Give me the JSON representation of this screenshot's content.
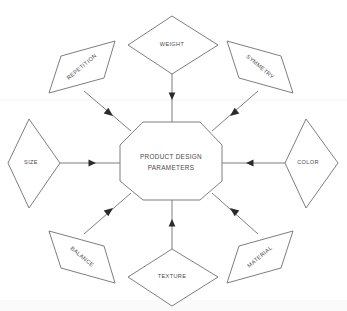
{
  "diagram": {
    "type": "radial-concept-map",
    "center": {
      "id": "center-node",
      "shape": "octagon",
      "label_line1": "PRODUCT DESIGN",
      "label_line2": "PARAMETERS"
    },
    "nodes": [
      {
        "id": "weight",
        "label": "WEIGHT",
        "shape": "diamond-horizontal",
        "position": "top",
        "rotation": 0,
        "arrow_direction": "down-toward-center"
      },
      {
        "id": "repetition",
        "label": "REPETITION",
        "shape": "parallelogram",
        "position": "top-left",
        "rotation": -45,
        "arrow_direction": "down-right-toward-center"
      },
      {
        "id": "symmetry",
        "label": "SYMMETRY",
        "shape": "parallelogram",
        "position": "top-right",
        "rotation": 45,
        "arrow_direction": "down-left-toward-center"
      },
      {
        "id": "size",
        "label": "SIZE",
        "shape": "diamond-vertical",
        "position": "left",
        "rotation": 0,
        "arrow_direction": "right-toward-center"
      },
      {
        "id": "color",
        "label": "COLOR",
        "shape": "diamond-vertical",
        "position": "right",
        "rotation": 0,
        "arrow_direction": "left-toward-center"
      },
      {
        "id": "balance",
        "label": "BALANCE",
        "shape": "parallelogram",
        "position": "bottom-left",
        "rotation": 45,
        "arrow_direction": "up-right-toward-center"
      },
      {
        "id": "material",
        "label": "MATERIAL",
        "shape": "parallelogram",
        "position": "bottom-right",
        "rotation": -45,
        "arrow_direction": "up-left-toward-center"
      },
      {
        "id": "texture",
        "label": "TEXTURE",
        "shape": "diamond-horizontal",
        "position": "bottom",
        "rotation": 0,
        "arrow_direction": "up-toward-center"
      }
    ],
    "colors": {
      "stroke": "#6f6f6f",
      "text": "#4a4a4a",
      "arrow": "#2b2b2b",
      "background": "#ffffff"
    }
  }
}
